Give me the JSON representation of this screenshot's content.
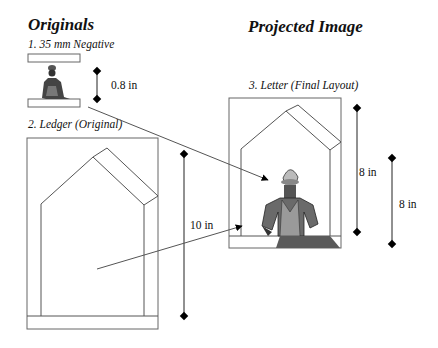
{
  "headings": {
    "originals": "Originals",
    "projected": "Projected Image"
  },
  "items": {
    "negative": {
      "label": "1. 35 mm Negative",
      "dimension": "0.8 in"
    },
    "ledger": {
      "label": "2. Ledger (Original)",
      "dimension": "10 in"
    },
    "letter": {
      "label": "3. Letter (Final Layout)",
      "dimension": "8 in"
    },
    "projected_image": {
      "dimension": "8 in"
    }
  },
  "colors": {
    "line": "#555555",
    "text": "#111111",
    "marker": "#000000"
  }
}
